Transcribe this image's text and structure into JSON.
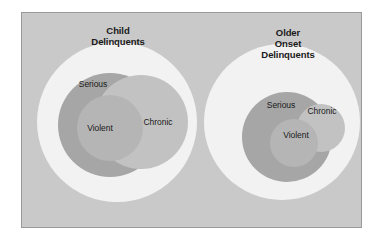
{
  "figure": {
    "background_color": "#ffffff",
    "frame": {
      "fill_color": "#c9c9c9",
      "border_color": "#9a9a9a"
    },
    "palette": {
      "outer_ring": "#f2f2f2",
      "serious": "#a6a6a6",
      "chronic": "#c2c2c2",
      "violent": "#b5b5b5",
      "text": "#1a1a1a"
    }
  },
  "diagrams": [
    {
      "id": "child-delinquents",
      "title": "Child\nDelinquents",
      "title_lines": [
        "Child",
        "Delinquents"
      ],
      "title_x": 118,
      "title_y": 36,
      "circles": [
        {
          "name": "outer",
          "label": "",
          "cx": 117,
          "cy": 122,
          "r": 80,
          "color": "#f2f2f2"
        },
        {
          "name": "serious",
          "label": "Serious",
          "cx": 110,
          "cy": 125,
          "r": 52,
          "color": "#a6a6a6"
        },
        {
          "name": "chronic",
          "label": "Chronic",
          "cx": 141,
          "cy": 122,
          "r": 47,
          "color": "#c2c2c2"
        },
        {
          "name": "violent",
          "label": "Violent",
          "cx": 110,
          "cy": 128,
          "r": 33,
          "color": "#b5b5b5"
        }
      ],
      "labels": [
        {
          "name": "serious",
          "text": "Serious",
          "x": 93,
          "y": 84
        },
        {
          "name": "chronic",
          "text": "Chronic",
          "x": 158,
          "y": 122
        },
        {
          "name": "violent",
          "text": "Violent",
          "x": 100,
          "y": 128
        }
      ]
    },
    {
      "id": "older-onset-delinquents",
      "title": "Older\nOnset\nDelinquents",
      "title_lines": [
        "Older",
        "Onset",
        "Delinquents"
      ],
      "title_x": 288,
      "title_y": 44,
      "circles": [
        {
          "name": "outer",
          "label": "",
          "cx": 282,
          "cy": 122,
          "r": 78,
          "color": "#f2f2f2"
        },
        {
          "name": "serious",
          "label": "Serious",
          "cx": 287,
          "cy": 137,
          "r": 45,
          "color": "#a6a6a6"
        },
        {
          "name": "chronic",
          "label": "Chronic",
          "cx": 321,
          "cy": 128,
          "r": 24,
          "color": "#c2c2c2"
        },
        {
          "name": "violent",
          "label": "Violent",
          "cx": 294,
          "cy": 143,
          "r": 24,
          "color": "#b5b5b5"
        }
      ],
      "labels": [
        {
          "name": "serious",
          "text": "Serious",
          "x": 281,
          "y": 105
        },
        {
          "name": "chronic",
          "text": "Chronic",
          "x": 322,
          "y": 111
        },
        {
          "name": "violent",
          "text": "Violent",
          "x": 296,
          "y": 135
        }
      ]
    }
  ]
}
